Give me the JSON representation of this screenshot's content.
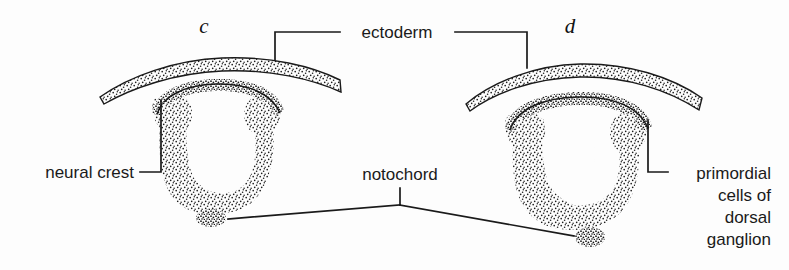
{
  "figure": {
    "background_color": "#fdfdfd",
    "ink_color": "#1a1a1a"
  },
  "panels": [
    {
      "letter": "c",
      "name": "panel-c",
      "description": "Cross-section with neural folds closing into neural tube"
    },
    {
      "letter": "d",
      "name": "panel-d",
      "description": "Cross-section with neural tube fully closed and ectoderm fused"
    }
  ],
  "labels": {
    "ectoderm": "ectoderm",
    "neural_crest": "neural crest",
    "notochord": "notochord",
    "primordial_line1": "primordial",
    "primordial_line2": "cells of",
    "primordial_line3": "dorsal",
    "primordial_line4": "ganglion"
  },
  "structures": {
    "ectoderm_layer": "ectoderm-layer",
    "neural_tube": "neural-tube",
    "neural_lumen": "neural-lumen",
    "neural_crest_mass": "neural-crest-mass",
    "notochord_spot": "notochord-spot"
  }
}
